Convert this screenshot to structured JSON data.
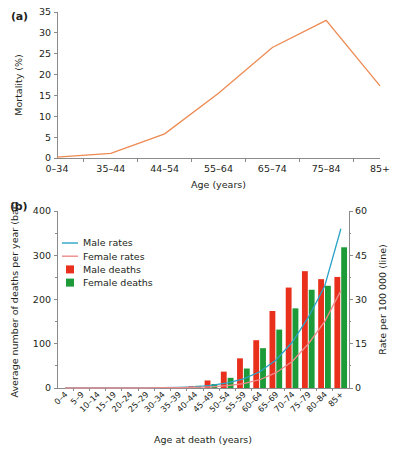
{
  "figure": {
    "panel_a_label": "(a)",
    "panel_b_label": "(b)"
  },
  "colors": {
    "mortality_line": "#ED8A52",
    "male_rate_line": "#2BA3C7",
    "female_rate_line": "#EE8B8B",
    "male_bar": "#E8301C",
    "female_bar": "#1D9B38",
    "axis": "#8b8b8b",
    "text": "#231f20",
    "background": "#ffffff"
  },
  "panel_a": {
    "label": "(a)",
    "xlabel": "Age (years)",
    "ylabel": "Mortality (%)",
    "yticks": [
      "0",
      "5",
      "10",
      "15",
      "20",
      "25",
      "30",
      "35"
    ],
    "xticks": [
      "0–34",
      "35–44",
      "44–54",
      "55–64",
      "65–74",
      "75–84",
      "85+"
    ],
    "chart_data": {
      "type": "line",
      "title": "",
      "xlabel": "Age (years)",
      "ylabel": "Mortality (%)",
      "categories": [
        "0–34",
        "35–44",
        "44–54",
        "55–64",
        "65–74",
        "75–84",
        "85+"
      ],
      "series": [
        {
          "name": "Mortality",
          "color": "#ED8A52",
          "values": [
            0.2,
            1.1,
            5.8,
            15.5,
            26.5,
            33.0,
            17.3
          ]
        }
      ],
      "ylim": [
        0,
        35
      ],
      "ytick_step": 5,
      "grid": false,
      "legend": "none"
    }
  },
  "panel_b": {
    "label": "(b)",
    "xlabel": "Age at death (years)",
    "ylabel_left": "Average number of deaths per year (bar)",
    "ylabel_right": "Rate per 100 000 (line)",
    "yticks_left": [
      "0",
      "100",
      "200",
      "300",
      "400"
    ],
    "yticks_right": [
      "0",
      "15",
      "30",
      "45",
      "60"
    ],
    "legend": [
      {
        "label": "Male rates",
        "type": "line",
        "color": "#2BA3C7"
      },
      {
        "label": "Female rates",
        "type": "line",
        "color": "#EE8B8B"
      },
      {
        "label": "Male deaths",
        "type": "bar",
        "color": "#E8301C"
      },
      {
        "label": "Female deaths",
        "type": "bar",
        "color": "#1D9B38"
      }
    ],
    "chart_data": {
      "type": "bar",
      "title": "",
      "xlabel": "Age at death (years)",
      "ylabel": "Average number of deaths per year (bar)",
      "ylabel_secondary": "Rate per 100 000 (line)",
      "categories": [
        "0–4",
        "5–9",
        "10–14",
        "15–19",
        "20–24",
        "25–29",
        "30–34",
        "35–39",
        "40–44",
        "45–49",
        "50–54",
        "55–59",
        "60–64",
        "65–69",
        "70–74",
        "75–79",
        "80–84",
        "85+"
      ],
      "series": [
        {
          "name": "Male deaths",
          "type": "bar",
          "axis": "left",
          "color": "#E8301C",
          "values": [
            0,
            0,
            0,
            0,
            0,
            0,
            0,
            1,
            4,
            17,
            37,
            67,
            108,
            174,
            227,
            264,
            246,
            251
          ]
        },
        {
          "name": "Female deaths",
          "type": "bar",
          "axis": "left",
          "color": "#1D9B38",
          "values": [
            0,
            0,
            0,
            0,
            0,
            0,
            0,
            1,
            5,
            9,
            23,
            44,
            90,
            132,
            180,
            222,
            231,
            318
          ]
        },
        {
          "name": "Male rates",
          "type": "line",
          "axis": "right",
          "color": "#2BA3C7",
          "values": [
            0,
            0,
            0,
            0,
            0,
            0,
            0.1,
            0.2,
            0.4,
            0.9,
            1.7,
            3.1,
            5.5,
            9.5,
            15.5,
            24.0,
            34.5,
            54.0
          ]
        },
        {
          "name": "Female rates",
          "type": "line",
          "axis": "right",
          "color": "#EE8B8B",
          "values": [
            0,
            0,
            0,
            0,
            0,
            0,
            0.1,
            0.1,
            0.2,
            0.4,
            0.8,
            1.5,
            2.8,
            5.2,
            9.0,
            15.0,
            22.5,
            33.0
          ]
        }
      ],
      "ylim_left": [
        0,
        400
      ],
      "ylim_right": [
        0,
        60
      ],
      "ytick_step_left": 100,
      "ytick_step_right": 15,
      "grid": false,
      "legend_position": "upper-left-inside"
    }
  }
}
